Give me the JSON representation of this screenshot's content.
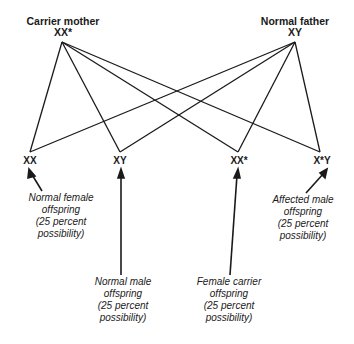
{
  "parents": {
    "mother": {
      "label": "Carrier mother",
      "genotype": "XX*"
    },
    "father": {
      "label": "Normal father",
      "genotype": "XY"
    }
  },
  "offspring": [
    {
      "genotype": "XX",
      "caption": [
        "Normal female",
        "offspring",
        "(25 percent",
        "possibility)"
      ]
    },
    {
      "genotype": "XY",
      "caption": [
        "Normal male",
        "offspring",
        "(25 percent",
        "possibility)"
      ]
    },
    {
      "genotype": "XX*",
      "caption": [
        "Female carrier",
        "offspring",
        "(25 percent",
        "possibility)"
      ]
    },
    {
      "genotype": "X*Y",
      "caption": [
        "Affected male",
        "offspring",
        "(25 percent",
        "possibility)"
      ]
    }
  ],
  "colors": {
    "line": "#1a1a1a",
    "background": "#ffffff"
  }
}
